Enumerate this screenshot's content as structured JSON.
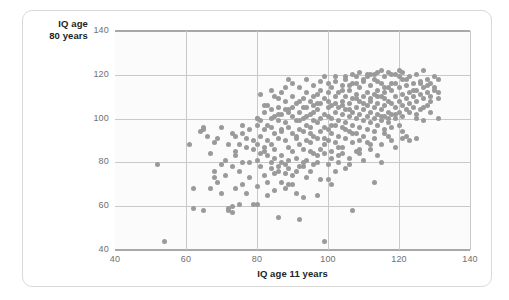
{
  "figure": {
    "card_border_color": "#d9d9d9",
    "plot_background": "#fbfbfb",
    "gridline_color": "#c9c9c9",
    "spine_color": "#a8a8a8",
    "marker_color": "#9a9a9a",
    "y_title_line1": "IQ age",
    "y_title_line2": "80 years",
    "x_title": "IQ age 11 years"
  },
  "chart_data": {
    "type": "scatter",
    "title": "",
    "xlabel": "IQ age 11 years",
    "ylabel": "IQ age 80 years",
    "xlim": [
      40,
      140
    ],
    "ylim": [
      40,
      140
    ],
    "xticks": [
      40,
      60,
      80,
      100,
      120,
      140
    ],
    "yticks": [
      40,
      60,
      80,
      100,
      120,
      140
    ],
    "grid": true,
    "legend": "none",
    "marker_color": "#9a9a9a",
    "marker_size_px": 5,
    "n_points": 420,
    "points": [
      [
        52,
        79
      ],
      [
        54,
        44
      ],
      [
        61,
        88
      ],
      [
        62,
        59
      ],
      [
        62,
        68
      ],
      [
        64,
        94
      ],
      [
        65,
        96
      ],
      [
        65,
        58
      ],
      [
        65,
        95
      ],
      [
        66,
        92
      ],
      [
        67,
        68
      ],
      [
        67,
        84
      ],
      [
        68,
        73
      ],
      [
        68,
        76
      ],
      [
        69,
        91
      ],
      [
        69,
        71
      ],
      [
        70,
        66
      ],
      [
        70,
        79
      ],
      [
        71,
        74
      ],
      [
        71,
        81
      ],
      [
        72,
        58
      ],
      [
        72,
        59
      ],
      [
        73,
        57
      ],
      [
        73,
        60
      ],
      [
        73,
        78
      ],
      [
        73,
        93
      ],
      [
        74,
        83
      ],
      [
        74,
        85
      ],
      [
        74,
        68
      ],
      [
        75,
        61
      ],
      [
        75,
        76
      ],
      [
        75,
        88
      ],
      [
        76,
        70
      ],
      [
        76,
        93
      ],
      [
        76,
        80
      ],
      [
        77,
        66
      ],
      [
        77,
        87
      ],
      [
        77,
        91
      ],
      [
        78,
        80
      ],
      [
        78,
        73
      ],
      [
        79,
        61
      ],
      [
        79,
        86
      ],
      [
        79,
        90
      ],
      [
        80,
        100
      ],
      [
        80,
        97
      ],
      [
        80,
        81
      ],
      [
        80,
        69
      ],
      [
        80,
        88
      ],
      [
        81,
        111
      ],
      [
        81,
        84
      ],
      [
        81,
        92
      ],
      [
        81,
        78
      ],
      [
        82,
        87
      ],
      [
        82,
        95
      ],
      [
        82,
        103
      ],
      [
        82,
        74
      ],
      [
        83,
        106
      ],
      [
        83,
        90
      ],
      [
        83,
        65
      ],
      [
        83,
        83
      ],
      [
        84,
        100
      ],
      [
        84,
        96
      ],
      [
        84,
        80
      ],
      [
        84,
        88
      ],
      [
        85,
        110
      ],
      [
        85,
        93
      ],
      [
        85,
        86
      ],
      [
        85,
        75
      ],
      [
        86,
        105
      ],
      [
        86,
        99
      ],
      [
        86,
        91
      ],
      [
        86,
        55
      ],
      [
        86,
        78
      ],
      [
        87,
        112
      ],
      [
        87,
        102
      ],
      [
        87,
        94
      ],
      [
        87,
        83
      ],
      [
        87,
        71
      ],
      [
        88,
        108
      ],
      [
        88,
        98
      ],
      [
        88,
        90
      ],
      [
        88,
        79
      ],
      [
        88,
        68
      ],
      [
        89,
        118
      ],
      [
        89,
        104
      ],
      [
        89,
        96
      ],
      [
        89,
        87
      ],
      [
        89,
        77
      ],
      [
        90,
        110
      ],
      [
        90,
        101
      ],
      [
        90,
        93
      ],
      [
        90,
        85
      ],
      [
        90,
        74
      ],
      [
        91,
        107
      ],
      [
        91,
        99
      ],
      [
        91,
        92
      ],
      [
        91,
        82
      ],
      [
        91,
        66
      ],
      [
        92,
        114
      ],
      [
        92,
        103
      ],
      [
        92,
        95
      ],
      [
        92,
        88
      ],
      [
        92,
        54
      ],
      [
        93,
        109
      ],
      [
        93,
        100
      ],
      [
        93,
        94
      ],
      [
        93,
        86
      ],
      [
        93,
        78
      ],
      [
        94,
        112
      ],
      [
        94,
        105
      ],
      [
        94,
        97
      ],
      [
        94,
        90
      ],
      [
        94,
        81
      ],
      [
        95,
        108
      ],
      [
        95,
        102
      ],
      [
        95,
        96
      ],
      [
        95,
        89
      ],
      [
        95,
        76
      ],
      [
        96,
        115
      ],
      [
        96,
        106
      ],
      [
        96,
        99
      ],
      [
        96,
        92
      ],
      [
        96,
        84
      ],
      [
        97,
        111
      ],
      [
        97,
        104
      ],
      [
        97,
        98
      ],
      [
        97,
        91
      ],
      [
        97,
        80
      ],
      [
        98,
        113
      ],
      [
        98,
        107
      ],
      [
        98,
        100
      ],
      [
        98,
        94
      ],
      [
        98,
        86
      ],
      [
        99,
        119
      ],
      [
        99,
        109
      ],
      [
        99,
        102
      ],
      [
        99,
        96
      ],
      [
        99,
        44
      ],
      [
        99,
        88
      ],
      [
        100,
        116
      ],
      [
        100,
        108
      ],
      [
        100,
        101
      ],
      [
        100,
        95
      ],
      [
        100,
        90
      ],
      [
        100,
        72
      ],
      [
        101,
        114
      ],
      [
        101,
        106
      ],
      [
        101,
        100
      ],
      [
        101,
        93
      ],
      [
        101,
        85
      ],
      [
        102,
        117
      ],
      [
        102,
        110
      ],
      [
        102,
        103
      ],
      [
        102,
        97
      ],
      [
        102,
        89
      ],
      [
        103,
        112
      ],
      [
        103,
        105
      ],
      [
        103,
        99
      ],
      [
        103,
        92
      ],
      [
        103,
        83
      ],
      [
        104,
        115
      ],
      [
        104,
        108
      ],
      [
        104,
        102
      ],
      [
        104,
        96
      ],
      [
        104,
        87
      ],
      [
        105,
        118
      ],
      [
        105,
        110
      ],
      [
        105,
        104
      ],
      [
        105,
        98
      ],
      [
        105,
        91
      ],
      [
        106,
        113
      ],
      [
        106,
        107
      ],
      [
        106,
        101
      ],
      [
        106,
        94
      ],
      [
        106,
        82
      ],
      [
        107,
        116
      ],
      [
        107,
        109
      ],
      [
        107,
        103
      ],
      [
        107,
        97
      ],
      [
        107,
        58
      ],
      [
        107,
        89
      ],
      [
        108,
        119
      ],
      [
        108,
        111
      ],
      [
        108,
        105
      ],
      [
        108,
        100
      ],
      [
        108,
        93
      ],
      [
        109,
        114
      ],
      [
        109,
        108
      ],
      [
        109,
        102
      ],
      [
        109,
        96
      ],
      [
        109,
        86
      ],
      [
        110,
        117
      ],
      [
        110,
        110
      ],
      [
        110,
        104
      ],
      [
        110,
        99
      ],
      [
        110,
        92
      ],
      [
        111,
        120
      ],
      [
        111,
        112
      ],
      [
        111,
        106
      ],
      [
        111,
        101
      ],
      [
        111,
        95
      ],
      [
        112,
        115
      ],
      [
        112,
        109
      ],
      [
        112,
        103
      ],
      [
        112,
        98
      ],
      [
        112,
        88
      ],
      [
        113,
        118
      ],
      [
        113,
        111
      ],
      [
        113,
        105
      ],
      [
        113,
        100
      ],
      [
        113,
        94
      ],
      [
        114,
        121
      ],
      [
        114,
        113
      ],
      [
        114,
        107
      ],
      [
        114,
        102
      ],
      [
        114,
        97
      ],
      [
        115,
        116
      ],
      [
        115,
        110
      ],
      [
        115,
        104
      ],
      [
        115,
        99
      ],
      [
        115,
        80
      ],
      [
        116,
        119
      ],
      [
        116,
        112
      ],
      [
        116,
        106
      ],
      [
        116,
        101
      ],
      [
        116,
        95
      ],
      [
        117,
        114
      ],
      [
        117,
        108
      ],
      [
        117,
        103
      ],
      [
        117,
        98
      ],
      [
        118,
        120
      ],
      [
        118,
        113
      ],
      [
        118,
        107
      ],
      [
        118,
        102
      ],
      [
        118,
        90
      ],
      [
        119,
        116
      ],
      [
        119,
        110
      ],
      [
        119,
        105
      ],
      [
        119,
        100
      ],
      [
        120,
        122
      ],
      [
        120,
        114
      ],
      [
        120,
        108
      ],
      [
        120,
        103
      ],
      [
        120,
        97
      ],
      [
        121,
        118
      ],
      [
        121,
        111
      ],
      [
        121,
        106
      ],
      [
        121,
        91
      ],
      [
        122,
        115
      ],
      [
        122,
        109
      ],
      [
        122,
        104
      ],
      [
        122,
        92
      ],
      [
        123,
        119
      ],
      [
        123,
        112
      ],
      [
        123,
        107
      ],
      [
        124,
        116
      ],
      [
        124,
        110
      ],
      [
        124,
        105
      ],
      [
        125,
        120
      ],
      [
        125,
        113
      ],
      [
        125,
        108
      ],
      [
        125,
        100
      ],
      [
        126,
        117
      ],
      [
        126,
        111
      ],
      [
        126,
        104
      ],
      [
        127,
        122
      ],
      [
        127,
        114
      ],
      [
        127,
        109
      ],
      [
        128,
        118
      ],
      [
        128,
        112
      ],
      [
        128,
        106
      ],
      [
        129,
        116
      ],
      [
        129,
        110
      ],
      [
        130,
        119
      ],
      [
        130,
        113
      ],
      [
        131,
        118
      ],
      [
        131,
        112
      ],
      [
        131,
        100
      ],
      [
        84,
        113
      ],
      [
        86,
        109
      ],
      [
        88,
        114
      ],
      [
        90,
        116
      ],
      [
        92,
        108
      ],
      [
        94,
        118
      ],
      [
        96,
        110
      ],
      [
        98,
        117
      ],
      [
        100,
        112
      ],
      [
        102,
        119
      ],
      [
        104,
        113
      ],
      [
        106,
        115
      ],
      [
        108,
        116
      ],
      [
        110,
        118
      ],
      [
        112,
        120
      ],
      [
        114,
        117
      ],
      [
        116,
        114
      ],
      [
        118,
        116
      ],
      [
        120,
        119
      ],
      [
        122,
        118
      ],
      [
        124,
        113
      ],
      [
        126,
        116
      ],
      [
        128,
        115
      ],
      [
        130,
        114
      ],
      [
        81,
        99
      ],
      [
        83,
        97
      ],
      [
        85,
        101
      ],
      [
        87,
        95
      ],
      [
        89,
        103
      ],
      [
        91,
        91
      ],
      [
        93,
        105
      ],
      [
        95,
        93
      ],
      [
        97,
        107
      ],
      [
        99,
        91
      ],
      [
        101,
        97
      ],
      [
        103,
        87
      ],
      [
        105,
        95
      ],
      [
        107,
        93
      ],
      [
        109,
        90
      ],
      [
        111,
        89
      ],
      [
        113,
        91
      ],
      [
        115,
        88
      ],
      [
        117,
        92
      ],
      [
        119,
        87
      ],
      [
        121,
        94
      ],
      [
        123,
        90
      ],
      [
        125,
        91
      ],
      [
        127,
        99
      ],
      [
        129,
        103
      ],
      [
        82,
        85
      ],
      [
        84,
        77
      ],
      [
        86,
        76
      ],
      [
        88,
        75
      ],
      [
        90,
        70
      ],
      [
        92,
        78
      ],
      [
        94,
        73
      ],
      [
        96,
        79
      ],
      [
        98,
        72
      ],
      [
        100,
        79
      ],
      [
        102,
        76
      ],
      [
        104,
        84
      ],
      [
        106,
        79
      ],
      [
        108,
        85
      ],
      [
        110,
        81
      ],
      [
        112,
        86
      ],
      [
        114,
        83
      ],
      [
        116,
        93
      ],
      [
        118,
        96
      ],
      [
        113,
        71
      ],
      [
        109,
        84
      ],
      [
        105,
        77
      ],
      [
        101,
        70
      ],
      [
        97,
        65
      ],
      [
        93,
        64
      ],
      [
        89,
        70
      ],
      [
        85,
        67
      ],
      [
        83,
        71
      ],
      [
        80,
        61
      ],
      [
        78,
        95
      ],
      [
        76,
        97
      ],
      [
        74,
        92
      ],
      [
        72,
        88
      ],
      [
        70,
        96
      ],
      [
        68,
        89
      ],
      [
        95,
        85
      ],
      [
        97,
        83
      ],
      [
        99,
        84
      ],
      [
        101,
        82
      ],
      [
        103,
        80
      ],
      [
        93,
        80
      ],
      [
        91,
        76
      ],
      [
        89,
        81
      ],
      [
        87,
        80
      ],
      [
        85,
        82
      ],
      [
        100,
        105
      ],
      [
        102,
        107
      ],
      [
        104,
        106
      ],
      [
        106,
        104
      ],
      [
        108,
        109
      ],
      [
        110,
        107
      ],
      [
        112,
        108
      ],
      [
        114,
        110
      ],
      [
        116,
        109
      ],
      [
        96,
        103
      ],
      [
        94,
        101
      ],
      [
        92,
        99
      ],
      [
        90,
        105
      ],
      [
        88,
        104
      ],
      [
        86,
        102
      ],
      [
        84,
        104
      ],
      [
        82,
        106
      ],
      [
        80,
        100
      ],
      [
        115,
        101
      ],
      [
        117,
        100
      ],
      [
        119,
        102
      ],
      [
        121,
        101
      ],
      [
        123,
        103
      ],
      [
        125,
        102
      ],
      [
        127,
        105
      ],
      [
        129,
        108
      ],
      [
        131,
        109
      ],
      [
        119,
        120
      ],
      [
        121,
        121
      ],
      [
        117,
        121
      ],
      [
        115,
        122
      ],
      [
        113,
        120
      ],
      [
        111,
        119
      ],
      [
        109,
        121
      ],
      [
        107,
        120
      ],
      [
        105,
        119
      ]
    ]
  }
}
